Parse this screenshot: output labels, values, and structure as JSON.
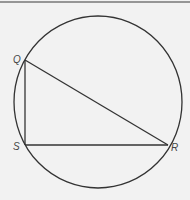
{
  "figure": {
    "labels": {
      "Q": "Q",
      "S": "S",
      "R": "R"
    },
    "circle": {
      "cx": 98,
      "cy": 102,
      "r": 85
    },
    "points": {
      "Q": [
        25,
        60
      ],
      "S": [
        25,
        145
      ],
      "R": [
        168,
        145
      ]
    },
    "stroke_color": "#333333",
    "frame_color": "#777777"
  }
}
